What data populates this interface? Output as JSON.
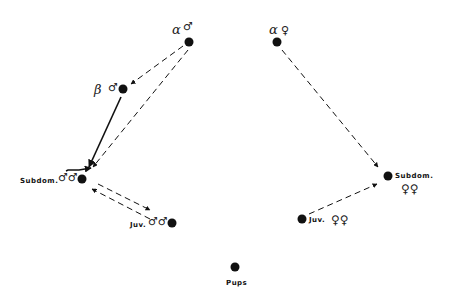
{
  "diagram": {
    "type": "dominance-hierarchy",
    "nodes": {
      "alpha_male": {
        "greek": "α",
        "sex_symbol": "♂"
      },
      "beta_male": {
        "greek": "β",
        "sex_symbol": "♂"
      },
      "subdom_males": {
        "label": "Subdom.",
        "sex_symbol": "♂♂"
      },
      "juv_males": {
        "label": "Juv.",
        "sex_symbol": "♂♂"
      },
      "alpha_female": {
        "greek": "α",
        "sex_symbol": "♀"
      },
      "subdom_females": {
        "label": "Subdom.",
        "sex_symbol": "♀♀"
      },
      "juv_females": {
        "label": "Juv.",
        "sex_symbol": "♀♀"
      },
      "pups": {
        "label": "Pups"
      }
    },
    "edges": [
      {
        "from": "alpha_male",
        "to": "beta_male",
        "style": "dashed"
      },
      {
        "from": "alpha_male",
        "to": "subdom_males",
        "style": "dashed"
      },
      {
        "from": "beta_male",
        "to": "subdom_males",
        "style": "solid"
      },
      {
        "from": "subdom_males",
        "to": "juv_males",
        "style": "dashed"
      },
      {
        "from": "juv_males",
        "to": "subdom_males",
        "style": "dashed"
      },
      {
        "from": "alpha_female",
        "to": "subdom_females",
        "style": "dashed"
      },
      {
        "from": "juv_females",
        "to": "subdom_females",
        "style": "dashed"
      }
    ],
    "colors": {
      "ink": "#111111",
      "background": "#ffffff"
    }
  }
}
